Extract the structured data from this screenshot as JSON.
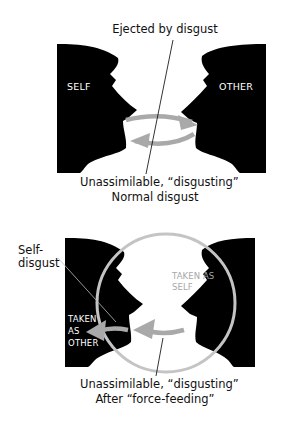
{
  "top_panel": {
    "label_top": "Ejected by disgust",
    "left_head_label": "SELF",
    "right_head_label": "OTHER",
    "label_bottom": "Unassimilable, “disgusting”",
    "caption": "Normal disgust"
  },
  "bottom_panel": {
    "callout_label_line1": "Self-",
    "callout_label_line2": "disgust",
    "right_inner_label_line1": "TAKEN AS",
    "right_inner_label_line2": "SELF",
    "left_inner_label_line1": "TAKEN",
    "left_inner_label_line2": "AS",
    "left_inner_label_line3": "OTHER",
    "label_bottom": "Unassimilable, “disgusting”",
    "caption": "After “force-feeding”"
  },
  "colors": {
    "silhouette": "#000000",
    "arrow": "#a9a9a9",
    "circle": "#c4c4c4",
    "background": "#ffffff"
  }
}
